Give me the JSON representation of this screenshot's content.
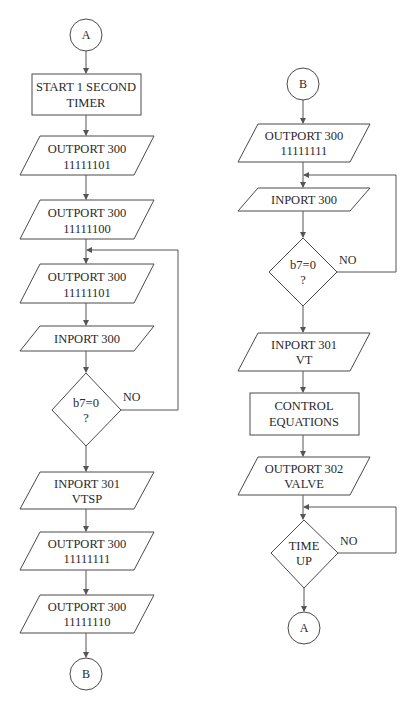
{
  "diagram": {
    "type": "flowchart",
    "left_column": {
      "start_connector": "A",
      "process_timer": [
        "START 1 SECOND",
        "TIMER"
      ],
      "io_1": [
        "OUTPORT 300",
        "11111101"
      ],
      "io_2": [
        "OUTPORT 300",
        "11111100"
      ],
      "io_3": [
        "OUTPORT 300",
        "11111101"
      ],
      "io_4": [
        "INPORT 300"
      ],
      "decision": [
        "b7=0",
        "?"
      ],
      "decision_no_label": "NO",
      "io_5": [
        "INPORT 301",
        "VTSP"
      ],
      "io_6": [
        "OUTPORT 300",
        "11111111"
      ],
      "io_7": [
        "OUTPORT 300",
        "11111110"
      ],
      "end_connector": "B"
    },
    "right_column": {
      "start_connector": "B",
      "io_1": [
        "OUTPORT 300",
        "11111111"
      ],
      "io_2": [
        "INPORT 300"
      ],
      "decision": [
        "b7=0",
        "?"
      ],
      "decision_no_label": "NO",
      "io_3": [
        "INPORT 301",
        "VT"
      ],
      "process_control": [
        "CONTROL",
        "EQUATIONS"
      ],
      "io_4": [
        "OUTPORT 302",
        "VALVE"
      ],
      "decision_time": [
        "TIME",
        "UP"
      ],
      "decision_time_no_label": "NO",
      "end_connector": "A"
    }
  }
}
